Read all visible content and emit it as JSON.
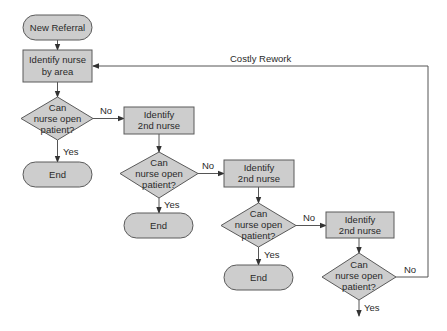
{
  "diagram": {
    "type": "flowchart",
    "colors": {
      "fill": "#cdcdcd",
      "stroke": "#5a5a5a",
      "text": "#2a2a2a"
    },
    "nodes": [
      {
        "id": "start",
        "kind": "terminal",
        "lines": [
          "New Referral"
        ]
      },
      {
        "id": "identify1",
        "kind": "process",
        "lines": [
          "Identify nurse",
          "by area"
        ]
      },
      {
        "id": "decision1",
        "kind": "decision",
        "lines": [
          "Can",
          "nurse open",
          "patient?"
        ]
      },
      {
        "id": "end1",
        "kind": "terminal",
        "lines": [
          "End"
        ]
      },
      {
        "id": "identify2",
        "kind": "process",
        "lines": [
          "Identify",
          "2nd nurse"
        ]
      },
      {
        "id": "decision2",
        "kind": "decision",
        "lines": [
          "Can",
          "nurse open",
          "patient?"
        ]
      },
      {
        "id": "end2",
        "kind": "terminal",
        "lines": [
          "End"
        ]
      },
      {
        "id": "identify3",
        "kind": "process",
        "lines": [
          "Identify",
          "2nd nurse"
        ]
      },
      {
        "id": "decision3",
        "kind": "decision",
        "lines": [
          "Can",
          "nurse open",
          "patient?"
        ]
      },
      {
        "id": "end3",
        "kind": "terminal",
        "lines": [
          "End"
        ]
      },
      {
        "id": "identify4",
        "kind": "process",
        "lines": [
          "Identify",
          "2nd nurse"
        ]
      },
      {
        "id": "decision4",
        "kind": "decision",
        "lines": [
          "Can",
          "nurse open",
          "patient?"
        ]
      }
    ],
    "edges": [
      {
        "from": "start",
        "to": "identify1",
        "label": ""
      },
      {
        "from": "identify1",
        "to": "decision1",
        "label": ""
      },
      {
        "from": "decision1",
        "to": "end1",
        "label": "Yes"
      },
      {
        "from": "decision1",
        "to": "identify2",
        "label": "No"
      },
      {
        "from": "identify2",
        "to": "decision2",
        "label": ""
      },
      {
        "from": "decision2",
        "to": "end2",
        "label": "Yes"
      },
      {
        "from": "decision2",
        "to": "identify3",
        "label": "No"
      },
      {
        "from": "identify3",
        "to": "decision3",
        "label": ""
      },
      {
        "from": "decision3",
        "to": "end3",
        "label": "Yes"
      },
      {
        "from": "decision3",
        "to": "identify4",
        "label": "No"
      },
      {
        "from": "identify4",
        "to": "decision4",
        "label": ""
      },
      {
        "from": "decision4",
        "to": "exit",
        "label": "Yes"
      },
      {
        "from": "decision4",
        "to": "identify1",
        "label": "No"
      }
    ],
    "annotations": {
      "rework_label": "Costly Rework"
    }
  }
}
